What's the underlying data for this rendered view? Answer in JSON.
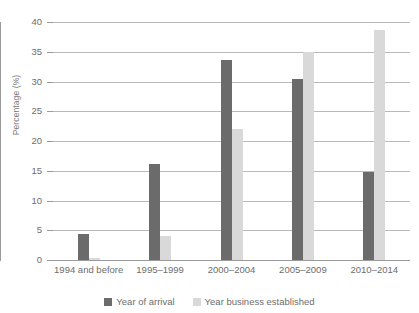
{
  "chart_data": {
    "type": "bar",
    "title": "",
    "subtitle": "",
    "xlabel": "",
    "ylabel": "Percentage (%)",
    "ylim": [
      0,
      40
    ],
    "ytick_step": 5,
    "yticks": [
      "40",
      "35",
      "30",
      "25",
      "20",
      "15",
      "10",
      "5",
      "0"
    ],
    "grid": true,
    "legend_position": "bottom",
    "categories": [
      "1994 and before",
      "1995–1999",
      "2000–2004",
      "2005–2009",
      "2010–2014"
    ],
    "series": [
      {
        "name": "Year of arrival",
        "color": "#6b6b6b",
        "values": [
          4.3,
          16.2,
          33.6,
          30.4,
          14.8
        ]
      },
      {
        "name": "Year business established",
        "color": "#d9d9d9",
        "values": [
          0.3,
          4.0,
          22.0,
          35.0,
          38.7
        ]
      }
    ]
  },
  "legend": {
    "items": [
      {
        "label": "Year of arrival"
      },
      {
        "label": "Year business established"
      }
    ]
  }
}
